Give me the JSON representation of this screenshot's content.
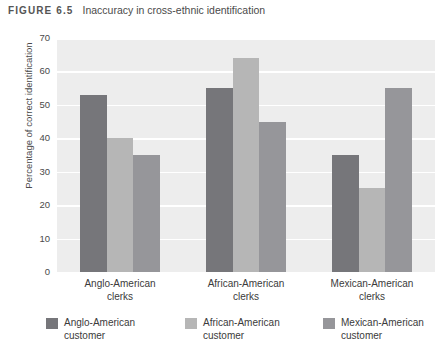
{
  "caption": {
    "figure_number": "FIGURE 6.5",
    "title": "Inaccuracy in cross-ethnic identification"
  },
  "chart_data": {
    "type": "bar",
    "title": "Inaccuracy in cross-ethnic identification",
    "xlabel": "",
    "ylabel": "Percentage of correct identification",
    "categories": [
      "Anglo-American clerks",
      "African-American clerks",
      "Mexican-American clerks"
    ],
    "category_lines": [
      [
        "Anglo-American",
        "clerks"
      ],
      [
        "African-American",
        "clerks"
      ],
      [
        "Mexican-American",
        "clerks"
      ]
    ],
    "series": [
      {
        "name": "Anglo-American customer",
        "name_lines": [
          "Anglo-American",
          "customer"
        ],
        "color": "#76767a",
        "values": [
          53,
          55,
          35
        ]
      },
      {
        "name": "African-American customer",
        "name_lines": [
          "African-American",
          "customer"
        ],
        "color": "#b6b6b6",
        "values": [
          40,
          64,
          25
        ]
      },
      {
        "name": "Mexican-American customer",
        "name_lines": [
          "Mexican-American",
          "customer"
        ],
        "color": "#96969a",
        "values": [
          35,
          45,
          55
        ]
      }
    ],
    "ylim": [
      0,
      70
    ],
    "yticks": [
      0,
      10,
      20,
      30,
      40,
      50,
      60,
      70
    ],
    "ytick_labels": [
      "0",
      "10",
      "20",
      "30",
      "40",
      "50",
      "60",
      "70"
    ],
    "grid": true,
    "grid_color": "#ffffff",
    "plot_background": "#ededed",
    "legend_position": "bottom"
  }
}
